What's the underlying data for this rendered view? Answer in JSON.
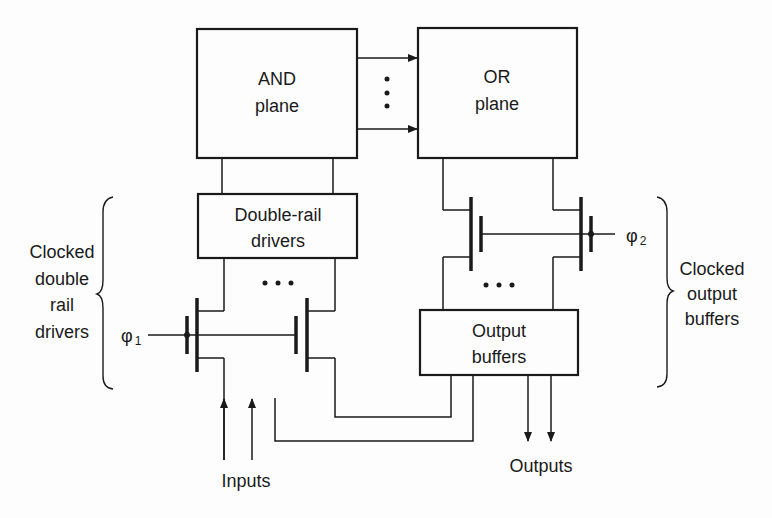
{
  "diagram": {
    "blocks": {
      "and_plane": {
        "line1": "AND",
        "line2": "plane"
      },
      "or_plane": {
        "line1": "OR",
        "line2": "plane"
      },
      "double_rail": {
        "line1": "Double-rail",
        "line2": "drivers"
      },
      "output_buffers": {
        "line1": "Output",
        "line2": "buffers"
      }
    },
    "clocks": {
      "phi1": {
        "symbol": "φ",
        "subscript": "1"
      },
      "phi2": {
        "symbol": "φ",
        "subscript": "2"
      }
    },
    "group_labels": {
      "left": [
        "Clocked",
        "double",
        "rail",
        "drivers"
      ],
      "right": [
        "Clocked",
        "output",
        "buffers"
      ]
    },
    "io_labels": {
      "inputs": "Inputs",
      "outputs": "Outputs"
    },
    "ellipsis": "• • •",
    "colors": {
      "stroke": "#1a1a1a",
      "background": "#fdfdfd"
    }
  }
}
